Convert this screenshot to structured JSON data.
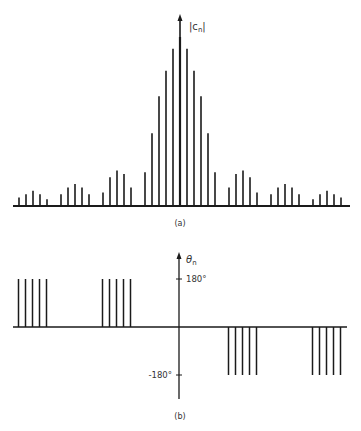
{
  "chart_data": [
    {
      "type": "bar",
      "style": "stem",
      "title": "",
      "panel_label": "(a)",
      "ylabel": "|c_n|",
      "ylabel_display": "|cn|",
      "xlabel": "n",
      "x": [
        -23,
        -22,
        -21,
        -20,
        -19,
        -18,
        -17,
        -16,
        -15,
        -14,
        -13,
        -12,
        -11,
        -10,
        -9,
        -8,
        -7,
        -6,
        -5,
        -4,
        -3,
        -2,
        -1,
        0,
        1,
        2,
        3,
        4,
        5,
        6,
        7,
        8,
        9,
        10,
        11,
        12,
        13,
        14,
        15,
        16,
        17,
        18,
        19,
        20,
        21,
        22,
        23
      ],
      "values": [
        0.05,
        0.07,
        0.09,
        0.07,
        0.04,
        0.0,
        0.07,
        0.11,
        0.13,
        0.11,
        0.07,
        0.0,
        0.08,
        0.17,
        0.21,
        0.19,
        0.11,
        0.0,
        0.2,
        0.43,
        0.65,
        0.8,
        0.93,
        1.0,
        0.93,
        0.8,
        0.65,
        0.43,
        0.2,
        0.0,
        0.11,
        0.19,
        0.21,
        0.17,
        0.08,
        0.0,
        0.07,
        0.11,
        0.13,
        0.11,
        0.07,
        0.0,
        0.04,
        0.07,
        0.09,
        0.07,
        0.05
      ],
      "ylim": [
        0,
        1.15
      ],
      "grid": false,
      "legend": null
    },
    {
      "type": "bar",
      "style": "stem",
      "title": "",
      "panel_label": "(b)",
      "ylabel": "θ_n",
      "ylabel_display": "θn",
      "xlabel": "n",
      "yticks": [
        180,
        -180
      ],
      "ytick_labels": [
        "180°",
        "-180°"
      ],
      "x": [
        -23,
        -22,
        -21,
        -20,
        -19,
        -18,
        -17,
        -16,
        -15,
        -14,
        -13,
        -12,
        -11,
        -10,
        -9,
        -8,
        -7,
        -6,
        -5,
        -4,
        -3,
        -2,
        -1,
        0,
        1,
        2,
        3,
        4,
        5,
        6,
        7,
        8,
        9,
        10,
        11,
        12,
        13,
        14,
        15,
        16,
        17,
        18,
        19,
        20,
        21,
        22,
        23
      ],
      "values": [
        180,
        180,
        180,
        180,
        180,
        0,
        0,
        0,
        0,
        0,
        0,
        0,
        180,
        180,
        180,
        180,
        180,
        0,
        0,
        0,
        0,
        0,
        0,
        0,
        0,
        0,
        0,
        0,
        0,
        0,
        -180,
        -180,
        -180,
        -180,
        -180,
        0,
        0,
        0,
        0,
        0,
        0,
        0,
        -180,
        -180,
        -180,
        -180,
        -180
      ],
      "ylim": [
        -225,
        270
      ],
      "grid": false,
      "legend": null
    }
  ],
  "labels": {
    "a": {
      "axis": "|c",
      "sub": "n",
      "close": "|",
      "panel": "(a)"
    },
    "b": {
      "axis": "θ",
      "sub": "n",
      "tick_pos": "180°",
      "tick_neg": "-180°",
      "panel": "(b)"
    }
  },
  "colors": {
    "ink": "#1a1a1a",
    "background": "#ffffff"
  }
}
